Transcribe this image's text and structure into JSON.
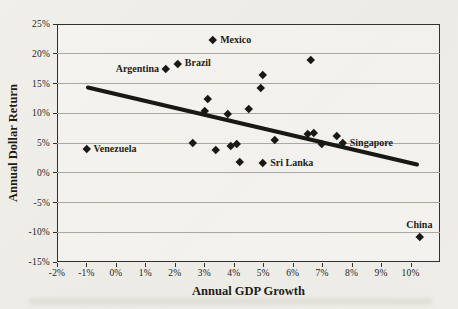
{
  "figure": {
    "colors": {
      "background": "#efede8",
      "marker": "#1a1813",
      "trend_line": "#1a1813",
      "gridline": "#aaa8a0",
      "frame": "#33312b",
      "text": "#26241e"
    }
  },
  "chart_data": {
    "type": "scatter",
    "title": "",
    "xlabel": "Annual GDP Growth",
    "ylabel": "Annual Dollar Return",
    "xlim": [
      -2,
      11
    ],
    "ylim": [
      -15,
      25
    ],
    "x_ticks": [
      -2,
      -1,
      0,
      1,
      2,
      3,
      4,
      5,
      6,
      7,
      8,
      9,
      10
    ],
    "y_ticks": [
      25,
      20,
      15,
      10,
      5,
      0,
      -5,
      -10,
      -15
    ],
    "tick_suffix": "%",
    "grid": "horizontal-only",
    "legend": "none",
    "labeled_points": [
      {
        "label": "Mexico",
        "x": 3.3,
        "y": 22.3,
        "label_side": "right"
      },
      {
        "label": "Brazil",
        "x": 2.1,
        "y": 18.4,
        "label_side": "right"
      },
      {
        "label": "Argentina",
        "x": 1.7,
        "y": 17.4,
        "label_side": "left"
      },
      {
        "label": "Venezuela",
        "x": -1.0,
        "y": 4.0,
        "label_side": "right"
      },
      {
        "label": "Sri Lanka",
        "x": 5.0,
        "y": 1.7,
        "label_side": "right"
      },
      {
        "label": "Singapore",
        "x": 7.7,
        "y": 5.0,
        "label_side": "right"
      },
      {
        "label": "China",
        "x": 10.3,
        "y": -10.7,
        "label_side": "above"
      }
    ],
    "unlabeled_points": [
      {
        "x": 3.1,
        "y": 12.5
      },
      {
        "x": 3.0,
        "y": 10.5
      },
      {
        "x": 3.8,
        "y": 10.0
      },
      {
        "x": 4.5,
        "y": 10.8
      },
      {
        "x": 5.0,
        "y": 16.4
      },
      {
        "x": 4.9,
        "y": 14.3
      },
      {
        "x": 6.6,
        "y": 19.0
      },
      {
        "x": 2.6,
        "y": 5.0
      },
      {
        "x": 3.4,
        "y": 3.8
      },
      {
        "x": 3.9,
        "y": 4.5
      },
      {
        "x": 4.1,
        "y": 4.8
      },
      {
        "x": 5.4,
        "y": 5.5
      },
      {
        "x": 4.2,
        "y": 1.9
      },
      {
        "x": 6.5,
        "y": 6.5
      },
      {
        "x": 6.7,
        "y": 6.7
      },
      {
        "x": 7.0,
        "y": 4.8
      },
      {
        "x": 7.5,
        "y": 6.3
      }
    ],
    "trend_line": {
      "x1": -1.0,
      "y1": 14.5,
      "x2": 10.3,
      "y2": 1.4
    }
  }
}
